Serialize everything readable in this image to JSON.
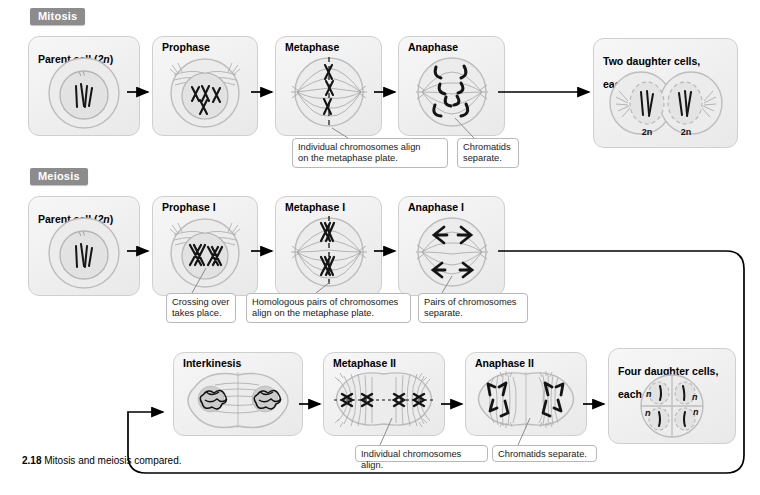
{
  "figure": {
    "caption_number": "2.18",
    "caption_text": "Mitosis and meiosis compared.",
    "colors": {
      "badge_bg": "#8c8c8c",
      "card_bg": "#f1f1f1",
      "card_border": "#cfcfcf",
      "note_border": "#b8b8b8",
      "chromosome": "#111111",
      "spindle": "#9a9a9a",
      "arrow": "#000000"
    }
  },
  "sections": [
    {
      "id": "mitosis",
      "label": "Mitosis"
    },
    {
      "id": "meiosis",
      "label": "Meiosis"
    }
  ],
  "mitosis": {
    "stages": [
      {
        "id": "parent-cell",
        "title": "Parent cell (2n)",
        "title_plain": "Parent cell (",
        "title_ital": "2n",
        "title_tail": ")"
      },
      {
        "id": "prophase",
        "title": "Prophase"
      },
      {
        "id": "metaphase",
        "title": "Metaphase"
      },
      {
        "id": "anaphase",
        "title": "Anaphase"
      },
      {
        "id": "two-daughter-cells",
        "title": "Two daughter cells,\neach 2n",
        "title_line1": "Two daughter cells,",
        "title_line2_plain": "each ",
        "title_line2_ital": "2n"
      }
    ],
    "daughter_labels": [
      "2n",
      "2n"
    ],
    "notes": [
      {
        "id": "metaphase-note",
        "text": "Individual chromosomes align\non the metaphase plate."
      },
      {
        "id": "anaphase-note",
        "text": "Chromatids\nseparate."
      }
    ]
  },
  "meiosis": {
    "stages_row1": [
      {
        "id": "parent-cell-m",
        "title": "Parent cell (2n)",
        "title_plain": "Parent cell (",
        "title_ital": "2n",
        "title_tail": ")"
      },
      {
        "id": "prophase-i",
        "title": "Prophase I"
      },
      {
        "id": "metaphase-i",
        "title": "Metaphase I"
      },
      {
        "id": "anaphase-i",
        "title": "Anaphase I"
      }
    ],
    "stages_row2": [
      {
        "id": "interkinesis",
        "title": "Interkinesis"
      },
      {
        "id": "metaphase-ii",
        "title": "Metaphase II"
      },
      {
        "id": "anaphase-ii",
        "title": "Anaphase II"
      },
      {
        "id": "four-daughter-cells",
        "title": "Four daughter cells,\neach n",
        "title_line1": "Four daughter cells,",
        "title_line2_plain": "each ",
        "title_line2_ital": "n"
      }
    ],
    "daughter_labels": [
      "n",
      "n",
      "n",
      "n"
    ],
    "notes_row1": [
      {
        "id": "prophase-i-note",
        "text": "Crossing over\ntakes place."
      },
      {
        "id": "metaphase-i-note",
        "text": "Homologous pairs of chromosomes\nalign on the metaphase plate."
      },
      {
        "id": "anaphase-i-note",
        "text": "Pairs of chromosomes\nseparate."
      }
    ],
    "notes_row2": [
      {
        "id": "metaphase-ii-note",
        "text": "Individual chromosomes align."
      },
      {
        "id": "anaphase-ii-note",
        "text": "Chromatids separate."
      }
    ]
  }
}
